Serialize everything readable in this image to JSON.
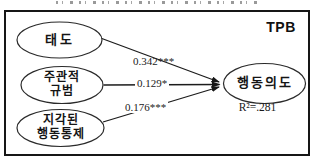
{
  "diagram": {
    "type": "path-model",
    "model_label": "TPB",
    "nodes": [
      {
        "id": "attitude",
        "label": "태도"
      },
      {
        "id": "subjective-norm",
        "label_line1": "주관적",
        "label_line2": "규범"
      },
      {
        "id": "perceived-behavioral-control",
        "label_line1": "지각된",
        "label_line2": "행동통제"
      },
      {
        "id": "behavioral-intention",
        "label": "행동의도",
        "r_squared": "R²=.281"
      }
    ],
    "edges": [
      {
        "from": "attitude",
        "to": "behavioral-intention",
        "coefficient": "0.342***"
      },
      {
        "from": "subjective-norm",
        "to": "behavioral-intention",
        "coefficient": "0.129*"
      },
      {
        "from": "perceived-behavioral-control",
        "to": "behavioral-intention",
        "coefficient": "0.176***"
      }
    ],
    "colors": {
      "stroke": "#1c1c1c",
      "background": "#ffffff"
    }
  }
}
